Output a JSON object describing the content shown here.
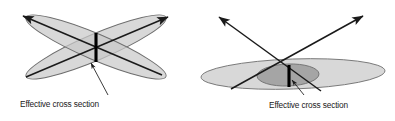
{
  "figure": {
    "background_color": "#ffffff",
    "panels": [
      {
        "id": "left",
        "name": "crossed-elongated-ellipses",
        "description": "Two elongated ellipses crossing at a steep angle with small overlap region",
        "caption": "Effective cross section",
        "ellipses": [
          {
            "name": "ellipse-up-right",
            "cx": 96,
            "cy": 47,
            "rx": 76,
            "ry": 13,
            "rotation_deg": -23,
            "fill": "#c9c9c9",
            "fill_opacity": 0.72,
            "stroke": "#6e6e6e",
            "stroke_width": 0.9
          },
          {
            "name": "ellipse-down-right",
            "cx": 96,
            "cy": 47,
            "rx": 76,
            "ry": 13,
            "rotation_deg": 23,
            "fill": "#c9c9c9",
            "fill_opacity": 0.72,
            "stroke": "#6e6e6e",
            "stroke_width": 0.9
          }
        ],
        "arrows": [
          {
            "name": "arrow-upper-left",
            "x1": 162,
            "y1": 75,
            "x2": 23,
            "y2": 16,
            "head_at": "end",
            "stroke": "#1a1a1a",
            "stroke_width": 1.5
          },
          {
            "name": "arrow-upper-right",
            "x1": 26,
            "y1": 77,
            "x2": 168,
            "y2": 17,
            "head_at": "end",
            "stroke": "#1a1a1a",
            "stroke_width": 1.5
          }
        ],
        "cross_section_bar": {
          "name": "effective-cross-section-bar",
          "x": 96,
          "y1": 33,
          "y2": 62,
          "stroke": "#000000",
          "stroke_width": 3.1
        },
        "leader": {
          "name": "caption-leader-line",
          "x1": 108,
          "y1": 95,
          "x2": 91,
          "y2": 63,
          "stroke": "#1a1a1a",
          "stroke_width": 0.85
        },
        "caption_pos": {
          "x": 20,
          "y": 107
        }
      },
      {
        "id": "right",
        "name": "flat-ellipse-with-core",
        "description": "One wide flat ellipse with a smaller dark core ellipse, crossed by two arrows; large overlap region",
        "caption": "Effective cross section",
        "ellipses": [
          {
            "name": "ellipse-wide-flat",
            "cx": 96,
            "cy": 74,
            "rx": 92,
            "ry": 15,
            "rotation_deg": -2,
            "fill": "#c9c9c9",
            "fill_opacity": 0.72,
            "stroke": "#6e6e6e",
            "stroke_width": 0.9
          },
          {
            "name": "ellipse-dark-core",
            "cx": 91,
            "cy": 75,
            "rx": 31,
            "ry": 11,
            "rotation_deg": -2,
            "fill": "#9c9c9c",
            "fill_opacity": 0.85,
            "stroke": "#6e6e6e",
            "stroke_width": 0.9
          }
        ],
        "arrows": [
          {
            "name": "arrow-upper-left",
            "x1": 124,
            "y1": 91,
            "x2": 22,
            "y2": 17,
            "head_at": "end",
            "stroke": "#1a1a1a",
            "stroke_width": 1.5
          },
          {
            "name": "arrow-upper-right",
            "x1": 34,
            "y1": 89,
            "x2": 166,
            "y2": 16,
            "head_at": "end",
            "stroke": "#1a1a1a",
            "stroke_width": 1.5
          }
        ],
        "cross_section_bar": {
          "name": "effective-cross-section-bar",
          "x": 92,
          "y1": 65,
          "y2": 87,
          "stroke": "#000000",
          "stroke_width": 3.1
        },
        "leader": {
          "name": "caption-leader-line",
          "x1": 107,
          "y1": 95,
          "x2": 95,
          "y2": 80,
          "stroke": "#1a1a1a",
          "stroke_width": 0.85
        },
        "caption_pos": {
          "x": 72,
          "y": 108
        }
      }
    ]
  }
}
